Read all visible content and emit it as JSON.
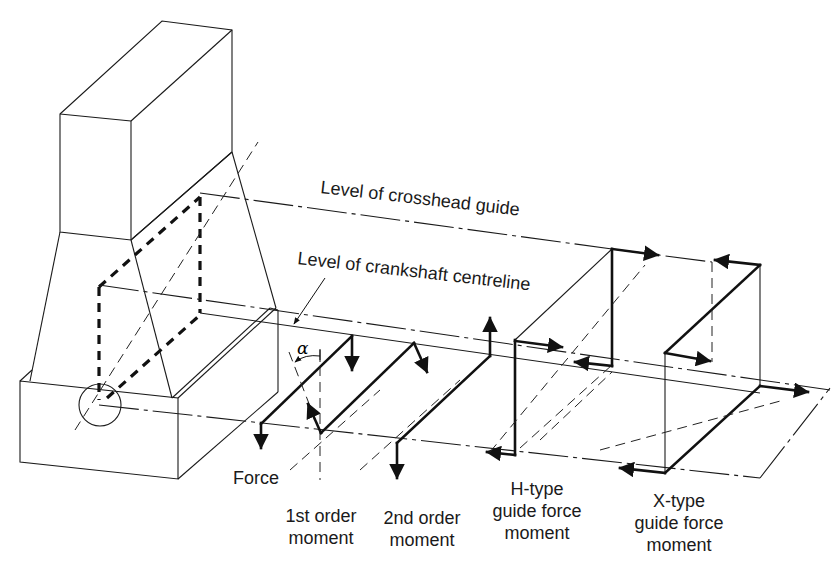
{
  "figure": {
    "colors": {
      "line": "#111111",
      "background": "#ffffff"
    }
  },
  "labels": {
    "crosshead_guide": "Level of crosshead guide",
    "crankshaft_centreline": "Level of crankshaft centreline",
    "alpha": "α",
    "force": "Force",
    "first_order": {
      "line1": "1st order",
      "line2": "moment"
    },
    "second_order": {
      "line1": "2nd order",
      "line2": "moment"
    },
    "h_type": {
      "line1": "H-type",
      "line2": "guide force",
      "line3": "moment"
    },
    "x_type": {
      "line1": "X-type",
      "line2": "guide force",
      "line3": "moment"
    }
  }
}
